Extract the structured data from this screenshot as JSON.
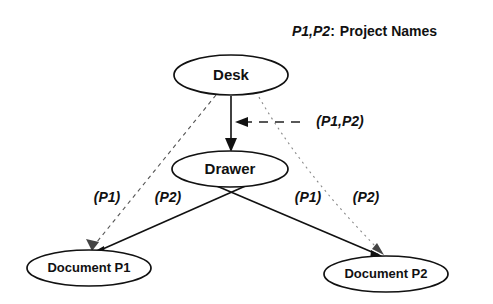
{
  "diagram": {
    "legend": {
      "symbols": "P1,P2",
      "separator": ":",
      "description": "Project Names"
    },
    "nodes": [
      {
        "id": "desk",
        "label": "Desk",
        "cx": 231,
        "cy": 75,
        "rx": 57,
        "ry": 20
      },
      {
        "id": "drawer",
        "label": "Drawer",
        "cx": 230,
        "cy": 169,
        "rx": 58,
        "ry": 18
      },
      {
        "id": "document-p1",
        "label": "Document P1",
        "cx": 89,
        "cy": 268,
        "rx": 62,
        "ry": 18
      },
      {
        "id": "document-p2",
        "label": "Document P2",
        "cx": 386,
        "cy": 274,
        "rx": 62,
        "ry": 18
      }
    ],
    "edges": [
      {
        "id": "desk-to-drawer",
        "from": "Desk",
        "to": "Drawer",
        "style": "solid",
        "label": "(P1,P2)"
      },
      {
        "id": "desk-to-document-p1",
        "from": "Desk",
        "to": "Document P1",
        "style": "dashed",
        "label": "(P1)"
      },
      {
        "id": "desk-to-document-p2",
        "from": "Desk",
        "to": "Document P2",
        "style": "dotted",
        "label": "(P2)"
      },
      {
        "id": "drawer-to-document-p1",
        "from": "Drawer",
        "to": "Document P1",
        "style": "solid",
        "label": "(P2)"
      },
      {
        "id": "drawer-to-document-p2",
        "from": "Drawer",
        "to": "Document P2",
        "style": "solid",
        "label": "(P1)"
      }
    ],
    "edge_labels": {
      "desk_drawer": "(P1,P2)",
      "left_outer": "(P1)",
      "left_inner": "(P2)",
      "right_inner": "(P1)",
      "right_outer": "(P2)"
    },
    "colors": {
      "ink": "#111111",
      "paper": "#ffffff",
      "faint": "#8a8a8a"
    }
  }
}
